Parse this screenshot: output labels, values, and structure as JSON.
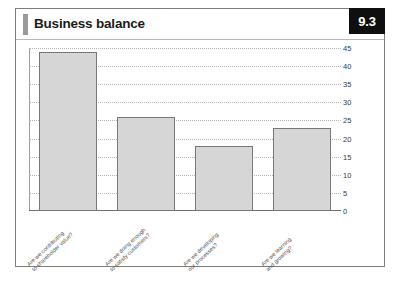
{
  "card": {
    "title": "Business balance",
    "badge": "9.3"
  },
  "chart_data": {
    "type": "bar",
    "title": "Business balance",
    "categories": [
      "Are we contributing\nto shareholder value?",
      "Are we doing enough\nto satisfy customers?",
      "Are we developing\nour processes?",
      "Are we learning\nand growing?"
    ],
    "category_lines": [
      [
        "Are we contributing",
        "to shareholder value?"
      ],
      [
        "Are we doing enough",
        "to satisfy customers?"
      ],
      [
        "Are we developing",
        "our processes?"
      ],
      [
        "Are we learning",
        "and growing?"
      ]
    ],
    "values": [
      44,
      26,
      18,
      23
    ],
    "xlabel": "",
    "ylabel": "",
    "ylim": [
      0,
      45
    ],
    "yticks": [
      0,
      5,
      10,
      15,
      20,
      25,
      30,
      35,
      40,
      45
    ],
    "ytick_labels": [
      "0",
      "5",
      "10",
      "15",
      "20",
      "25",
      "30",
      "35",
      "40",
      "45"
    ],
    "grid": true,
    "legend": false,
    "bar_color": "#d6d6d6",
    "bar_edge_color": "#787878"
  }
}
